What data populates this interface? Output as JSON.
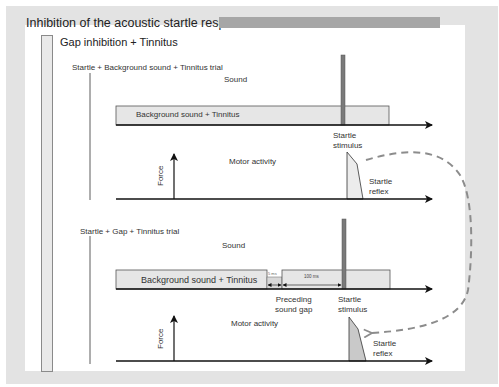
{
  "figure": {
    "title": "Inhibition of the acoustic startle response",
    "section_title": "Gap inhibition + Tinnitus"
  },
  "trial1": {
    "label": "Startle + Background sound + Tinnitus trial",
    "sound_label": "Sound",
    "background_label": "Background sound + Tinnitus",
    "stimulus_label_line1": "Startle",
    "stimulus_label_line2": "stimulus",
    "motor_label": "Motor activity",
    "force_label": "Force",
    "reflex_label_line1": "Startle",
    "reflex_label_line2": "reflex"
  },
  "trial2": {
    "label": "Startle + Gap + Tinnitus trial",
    "sound_label": "Sound",
    "background_label": "Background sound + Tinnitus",
    "gap_duration_label": "5 ms",
    "interval_label": "100 ms",
    "gap_label_line1": "Preceding",
    "gap_label_line2": "sound gap",
    "stimulus_label_line1": "Startle",
    "stimulus_label_line2": "stimulus",
    "motor_label": "Motor activity",
    "force_label": "Force",
    "reflex_label_line1": "Startle",
    "reflex_label_line2": "reflex"
  },
  "colors": {
    "frame": "#e3e3e3",
    "title_bar": "#a6a6a6",
    "stimulus_bar": "#7a7a7a",
    "background_box": "#e6e6e6",
    "dashed_arrow": "#8c8c8c"
  }
}
